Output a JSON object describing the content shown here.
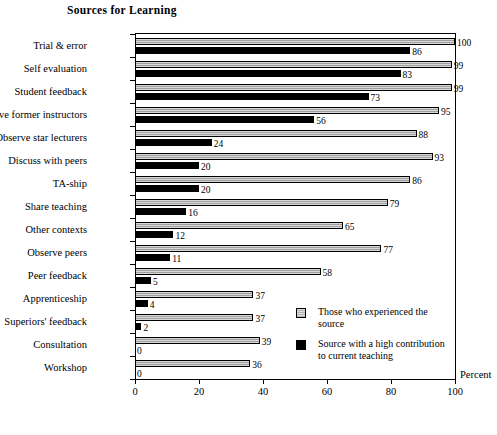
{
  "chart_data": {
    "type": "bar",
    "orientation": "horizontal",
    "title": "Sources for Learning",
    "xlabel": "Percent",
    "ylabel": "",
    "xlim": [
      0,
      100
    ],
    "xticks": [
      0,
      20,
      40,
      60,
      80,
      100
    ],
    "grid": false,
    "legend_position": "inside-lower-right",
    "categories": [
      "Trial & error",
      "Self evaluation",
      "Student feedback",
      "Observe former instructors",
      "Observe star lecturers",
      "Discuss with peers",
      "TA-ship",
      "Share teaching",
      "Other contexts",
      "Observe peers",
      "Peer feedback",
      "Apprenticeship",
      "Superiors' feedback",
      "Consultation",
      "Workshop"
    ],
    "series": [
      {
        "name": "Those who experienced the source",
        "color": "#a8a8a8",
        "values": [
          100,
          99,
          99,
          95,
          88,
          93,
          86,
          79,
          65,
          77,
          58,
          37,
          37,
          39,
          36
        ]
      },
      {
        "name": "Source with a high contribution to current teaching",
        "color": "#000000",
        "values": [
          86,
          83,
          73,
          56,
          24,
          20,
          20,
          16,
          12,
          11,
          5,
          4,
          2,
          0,
          0
        ]
      }
    ]
  },
  "legend": {
    "entries": [
      {
        "icon": "legend-swatch-gray",
        "line1": "Those who experienced the",
        "line2": "source"
      },
      {
        "icon": "legend-swatch-black",
        "line1": "Source with a high contribution",
        "line2": "to current teaching"
      }
    ]
  }
}
